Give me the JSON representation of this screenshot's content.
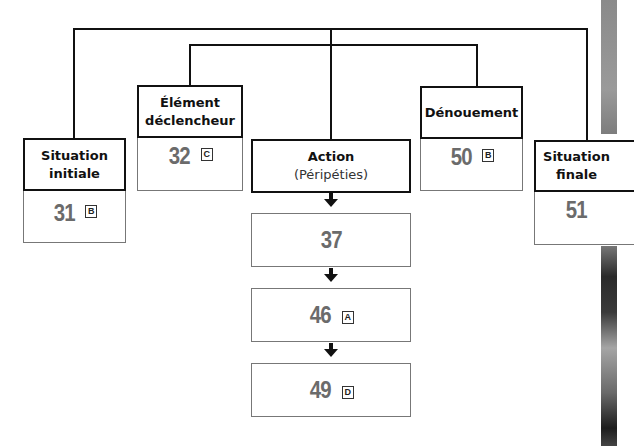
{
  "diagram": {
    "type": "narrative-schema",
    "stages": {
      "situation_initiale": {
        "title_line1": "Situation",
        "title_line2": "initiale",
        "page": "31",
        "badge": "B"
      },
      "element_declencheur": {
        "title_line1": "Élément",
        "title_line2": "déclencheur",
        "page": "32",
        "badge": "C"
      },
      "action": {
        "title": "Action",
        "subtitle": "(Péripéties)"
      },
      "denouement": {
        "title": "Dénouement",
        "page": "50",
        "badge": "B"
      },
      "situation_finale": {
        "title_line1": "Situation",
        "title_line2": "finale",
        "page": "51"
      }
    },
    "action_steps": [
      {
        "page": "37",
        "badge": ""
      },
      {
        "page": "46",
        "badge": "A"
      },
      {
        "page": "49",
        "badge": "D"
      }
    ],
    "colors": {
      "line": "#111111",
      "number": "#6b6b6b",
      "value_border": "#777777"
    }
  }
}
